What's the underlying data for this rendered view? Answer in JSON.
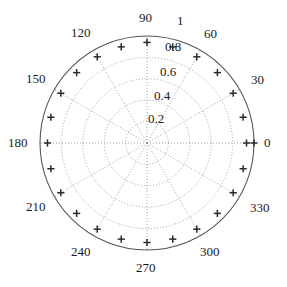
{
  "chart_data": {
    "type": "scatter",
    "projection": "polar",
    "title": "",
    "xlabel": "",
    "ylabel": "",
    "rlim": [
      0,
      1
    ],
    "theta_unit": "degrees",
    "theta_direction": "counterclockwise",
    "theta_zero_location": "E",
    "grid": true,
    "grid_style": "dotted",
    "legend": null,
    "angular_ticks": [
      0,
      30,
      60,
      90,
      120,
      150,
      180,
      210,
      240,
      270,
      300,
      330
    ],
    "angular_tick_labels": [
      "0",
      "30",
      "60",
      "90",
      "120",
      "150",
      "180",
      "210",
      "240",
      "270",
      "300",
      "330"
    ],
    "radial_ticks": [
      0.2,
      0.4,
      0.6,
      0.8,
      1
    ],
    "radial_tick_labels": [
      "0.2",
      "0.4",
      "0.6",
      "0.8",
      "1"
    ],
    "marker": "plus",
    "marker_color": "#2a2a2a",
    "series": [
      {
        "name": "pattern",
        "theta": [
          0,
          15,
          30,
          45,
          60,
          75,
          90,
          105,
          120,
          135,
          150,
          165,
          180,
          195,
          210,
          225,
          240,
          255,
          270,
          285,
          300,
          315,
          330,
          345
        ],
        "r": [
          0.93,
          0.93,
          0.93,
          0.93,
          0.93,
          0.93,
          0.94,
          0.93,
          0.93,
          0.93,
          0.93,
          0.93,
          0.93,
          0.93,
          0.93,
          0.93,
          0.93,
          0.93,
          0.93,
          0.93,
          0.93,
          0.93,
          0.93,
          0.93
        ]
      },
      {
        "name": "boundary-point",
        "theta": [
          0
        ],
        "r": [
          1.0
        ]
      }
    ]
  },
  "axes": {
    "center_x": 147,
    "center_y": 143,
    "radius_px": 107,
    "outline_color": "#555555",
    "grid_color": "#8a8a8a",
    "label_color": "#1a1a1a"
  },
  "labels": {
    "angle": {
      "a0": "0",
      "a30": "30",
      "a60": "60",
      "a90": "90",
      "a120": "120",
      "a150": "150",
      "a180": "180",
      "a210": "210",
      "a240": "240",
      "a270": "270",
      "a300": "300",
      "a330": "330"
    },
    "radial": {
      "r02": "0.2",
      "r04": "0.4",
      "r06": "0.6",
      "r08": "0.8",
      "r10": "1"
    }
  }
}
